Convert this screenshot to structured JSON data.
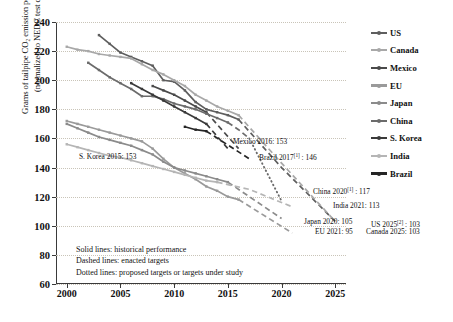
{
  "chart_data": {
    "type": "line",
    "title": "",
    "ylabel_line1": "Grams of tailpipe CO₂ emission per kilometer",
    "ylabel_line2": "(normalized to NEDC test cycle)",
    "xlabel": "",
    "xlim": [
      1999,
      2026
    ],
    "ylim": [
      60,
      240
    ],
    "yticks": [
      240,
      220,
      200,
      180,
      160,
      140,
      120,
      100,
      80,
      60
    ],
    "xticks": [
      2000,
      2005,
      2010,
      2015,
      2020,
      2025
    ],
    "grid": "horizontal-dotted",
    "legend_position": "right",
    "series": [
      {
        "name": "US",
        "color": "#5e5e5e",
        "historical": [
          [
            2003,
            231
          ],
          [
            2004,
            225
          ],
          [
            2005,
            219
          ],
          [
            2006,
            216
          ],
          [
            2007,
            213
          ],
          [
            2008,
            210
          ],
          [
            2009,
            200
          ],
          [
            2010,
            199
          ],
          [
            2011,
            193
          ],
          [
            2012,
            185
          ],
          [
            2013,
            180
          ],
          [
            2014,
            178
          ],
          [
            2015,
            176
          ],
          [
            2016,
            173
          ]
        ],
        "enacted": [
          [
            2016,
            173
          ],
          [
            2020,
            140
          ],
          [
            2025,
            103
          ]
        ],
        "proposed": []
      },
      {
        "name": "Canada",
        "color": "#a8a8a8",
        "historical": [
          [
            2000,
            223
          ],
          [
            2001,
            221
          ],
          [
            2002,
            220
          ],
          [
            2003,
            218
          ],
          [
            2004,
            217
          ],
          [
            2005,
            216
          ],
          [
            2006,
            215
          ],
          [
            2007,
            211
          ],
          [
            2008,
            207
          ],
          [
            2009,
            204
          ],
          [
            2010,
            200
          ],
          [
            2011,
            196
          ],
          [
            2012,
            190
          ],
          [
            2013,
            186
          ],
          [
            2014,
            182
          ],
          [
            2015,
            179
          ],
          [
            2016,
            176
          ]
        ],
        "enacted": [
          [
            2016,
            176
          ],
          [
            2020,
            143
          ],
          [
            2025,
            103
          ]
        ],
        "proposed": []
      },
      {
        "name": "Mexico",
        "color": "#4a4a4a",
        "historical": [
          [
            2008,
            196
          ],
          [
            2009,
            193
          ],
          [
            2010,
            190
          ],
          [
            2011,
            186
          ],
          [
            2012,
            182
          ],
          [
            2013,
            178
          ]
        ],
        "enacted": [
          [
            2013,
            178
          ],
          [
            2016,
            153
          ]
        ],
        "proposed": []
      },
      {
        "name": "EU",
        "color": "#9a9a9a",
        "historical": [
          [
            2000,
            172
          ],
          [
            2001,
            170
          ],
          [
            2002,
            168
          ],
          [
            2003,
            166
          ],
          [
            2004,
            164
          ],
          [
            2005,
            162
          ],
          [
            2006,
            160
          ],
          [
            2007,
            158
          ],
          [
            2008,
            153
          ],
          [
            2009,
            146
          ],
          [
            2010,
            140
          ],
          [
            2011,
            136
          ],
          [
            2012,
            132
          ],
          [
            2013,
            127
          ],
          [
            2014,
            124
          ],
          [
            2015,
            120
          ],
          [
            2016,
            118
          ]
        ],
        "enacted": [
          [
            2016,
            118
          ],
          [
            2021,
            95
          ]
        ],
        "proposed": []
      },
      {
        "name": "Japan",
        "color": "#8b8b8b",
        "historical": [
          [
            2000,
            170
          ],
          [
            2001,
            167
          ],
          [
            2002,
            164
          ],
          [
            2003,
            161
          ],
          [
            2004,
            159
          ],
          [
            2005,
            157
          ],
          [
            2006,
            155
          ],
          [
            2007,
            152
          ],
          [
            2008,
            149
          ],
          [
            2009,
            144
          ],
          [
            2010,
            140
          ],
          [
            2011,
            138
          ],
          [
            2012,
            136
          ],
          [
            2013,
            134
          ],
          [
            2014,
            132
          ],
          [
            2015,
            130
          ]
        ],
        "enacted": [
          [
            2015,
            130
          ],
          [
            2020,
            105
          ]
        ],
        "proposed": []
      },
      {
        "name": "China",
        "color": "#6b6b6b",
        "historical": [
          [
            2002,
            212
          ],
          [
            2003,
            207
          ],
          [
            2004,
            202
          ],
          [
            2005,
            198
          ],
          [
            2006,
            194
          ],
          [
            2007,
            189
          ],
          [
            2008,
            189
          ],
          [
            2009,
            187
          ],
          [
            2010,
            184
          ],
          [
            2011,
            182
          ],
          [
            2012,
            180
          ],
          [
            2013,
            177
          ],
          [
            2014,
            174
          ],
          [
            2015,
            171
          ]
        ],
        "enacted": [
          [
            2015,
            171
          ],
          [
            2016,
            166
          ],
          [
            2017,
            160
          ]
        ],
        "proposed": [
          [
            2017,
            160
          ],
          [
            2020,
            117
          ]
        ]
      },
      {
        "name": "S. Korea",
        "color": "#3a3a3a",
        "historical": [
          [
            2006,
            198
          ],
          [
            2007,
            194
          ],
          [
            2008,
            190
          ],
          [
            2009,
            186
          ],
          [
            2010,
            182
          ],
          [
            2011,
            178
          ],
          [
            2012,
            174
          ],
          [
            2013,
            170
          ]
        ],
        "enacted": [
          [
            2013,
            170
          ],
          [
            2015,
            153
          ]
        ],
        "proposed": []
      },
      {
        "name": "India",
        "color": "#b5b5b5",
        "historical": [
          [
            2000,
            156
          ],
          [
            2001,
            154
          ],
          [
            2002,
            152
          ],
          [
            2003,
            150
          ],
          [
            2004,
            148
          ],
          [
            2005,
            147
          ],
          [
            2006,
            145
          ],
          [
            2007,
            143
          ],
          [
            2008,
            141
          ],
          [
            2009,
            139
          ],
          [
            2010,
            137
          ],
          [
            2011,
            135
          ],
          [
            2012,
            133
          ],
          [
            2013,
            131
          ],
          [
            2014,
            130
          ]
        ],
        "enacted": [
          [
            2014,
            130
          ],
          [
            2017,
            125
          ],
          [
            2021,
            113
          ]
        ],
        "proposed": []
      },
      {
        "name": "Brazil",
        "color": "#252525",
        "historical": [
          [
            2011,
            168
          ],
          [
            2012,
            166
          ],
          [
            2013,
            165
          ]
        ],
        "enacted": [
          [
            2013,
            165
          ],
          [
            2017,
            146
          ]
        ],
        "proposed": []
      }
    ],
    "annotations": [
      {
        "id": "mexico",
        "text": "Mexico 2016: 153",
        "sup": "",
        "x": 233,
        "y": 138
      },
      {
        "id": "skorea",
        "text": "S. Korea 2015: 153",
        "sup": "",
        "x": 79,
        "y": 153
      },
      {
        "id": "brazil",
        "text": "Brazil 2017",
        "sup": "[1]",
        "tail": " : 146",
        "x": 259,
        "y": 151
      },
      {
        "id": "china",
        "text": "China 2020",
        "sup": "[1]",
        "tail": " : 117",
        "x": 313,
        "y": 185
      },
      {
        "id": "india",
        "text": "India 2021: 113",
        "sup": "",
        "x": 333,
        "y": 202
      },
      {
        "id": "japan",
        "text": "Japan 2020: 105",
        "sup": "",
        "x": 304,
        "y": 218
      },
      {
        "id": "us",
        "text": "US 2025",
        "sup": "[2]",
        "tail": " : 103",
        "x": 371,
        "y": 218
      },
      {
        "id": "eu",
        "text": "EU 2021: 95",
        "sup": "",
        "x": 315,
        "y": 228
      },
      {
        "id": "canada",
        "text": "Canada 2025: 103",
        "sup": "",
        "x": 366,
        "y": 228
      }
    ],
    "style_key": [
      "Solid lines: historical performance",
      "Dashed lines: enacted targets",
      "Dotted lines: proposed targets or targets under study"
    ]
  },
  "legend": {
    "items": [
      {
        "label": "US",
        "color": "#5e5e5e"
      },
      {
        "label": "Canada",
        "color": "#a8a8a8"
      },
      {
        "label": "Mexico",
        "color": "#4a4a4a"
      },
      {
        "label": "EU",
        "color": "#9a9a9a"
      },
      {
        "label": "Japan",
        "color": "#8b8b8b"
      },
      {
        "label": "China",
        "color": "#6b6b6b"
      },
      {
        "label": "S. Korea",
        "color": "#3a3a3a"
      },
      {
        "label": "India",
        "color": "#b5b5b5"
      },
      {
        "label": "Brazil",
        "color": "#252525"
      }
    ]
  }
}
